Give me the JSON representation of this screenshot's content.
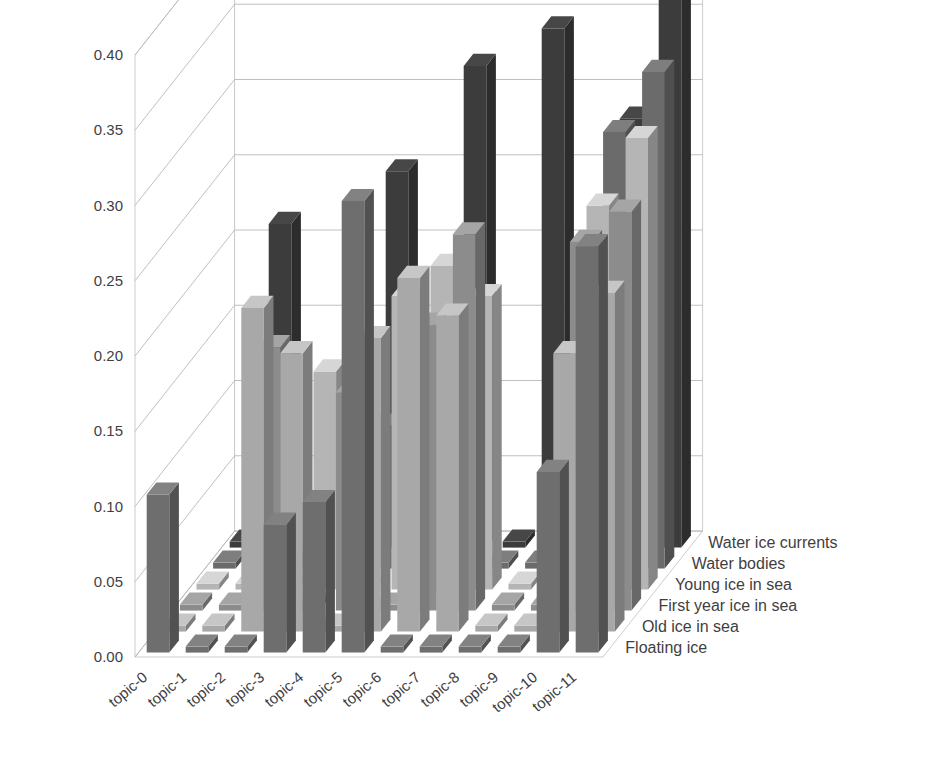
{
  "chart_data": {
    "type": "bar",
    "subtype": "3d-column",
    "title": "",
    "xlabel": "",
    "ylabel": "",
    "zlabel": "",
    "grid": true,
    "legend_position": "right-depth-axis",
    "categories": [
      "topic-0",
      "topic-1",
      "topic-2",
      "topic-3",
      "topic-4",
      "topic-5",
      "topic-6",
      "topic-7",
      "topic-8",
      "topic-9",
      "topic-10",
      "topic-11"
    ],
    "ylim": [
      0.0,
      0.4
    ],
    "ytick_labels": [
      "0.00",
      "0.05",
      "0.10",
      "0.15",
      "0.20",
      "0.25",
      "0.30",
      "0.35",
      "0.40"
    ],
    "yticks": [
      0.0,
      0.05,
      0.1,
      0.15,
      0.2,
      0.25,
      0.3,
      0.35,
      0.4
    ],
    "series": [
      {
        "name": "Floating ice",
        "color": "#6e6e6e",
        "values": [
          0.105,
          0.0,
          0.0,
          0.085,
          0.1,
          0.3,
          0.0,
          0.0,
          0.0,
          0.0,
          0.12,
          0.27
        ]
      },
      {
        "name": "Old ice in sea",
        "color": "#a8a8a8",
        "values": [
          0.0,
          0.0,
          0.215,
          0.185,
          0.0,
          0.195,
          0.235,
          0.21,
          0.0,
          0.0,
          0.185,
          0.225
        ]
      },
      {
        "name": "First year ice in sea",
        "color": "#8c8c8c",
        "values": [
          0.0,
          0.0,
          0.175,
          0.0,
          0.145,
          0.0,
          0.19,
          0.25,
          0.0,
          0.0,
          0.245,
          0.265
        ]
      },
      {
        "name": "Young ice in sea",
        "color": "#b5b5b5",
        "values": [
          0.0,
          0.0,
          0.0,
          0.145,
          0.0,
          0.195,
          0.215,
          0.195,
          0.0,
          0.0,
          0.255,
          0.3
        ]
      },
      {
        "name": "Water bodies",
        "color": "#6b6b6b",
        "values": [
          0.0,
          0.0,
          0.0,
          0.0,
          0.095,
          0.0,
          0.0,
          0.0,
          0.0,
          0.0,
          0.29,
          0.33
        ]
      },
      {
        "name": "Water ice currents",
        "color": "#3c3c3c",
        "values": [
          0.0,
          0.215,
          0.0,
          0.0,
          0.25,
          0.0,
          0.32,
          0.0,
          0.345,
          0.0,
          0.285,
          0.395
        ]
      }
    ]
  },
  "axes": {
    "value_axis_name": "value-axis",
    "category_axis_name": "category-axis",
    "series_axis_name": "series-axis"
  }
}
